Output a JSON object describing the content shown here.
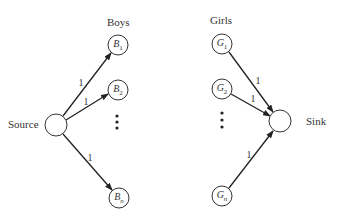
{
  "headings": {
    "boys": "Boys",
    "girls": "Girls",
    "source": "Source",
    "sink": "Sink"
  },
  "nodes": {
    "source": {
      "x": 56,
      "y": 125,
      "r": 11
    },
    "sink": {
      "x": 280,
      "y": 121,
      "r": 11
    },
    "boys": [
      {
        "name": "B",
        "sub": "1",
        "x": 118,
        "y": 45,
        "r": 10
      },
      {
        "name": "B",
        "sub": "2",
        "x": 118,
        "y": 90,
        "r": 10
      },
      {
        "name": "B",
        "sub": "n",
        "x": 119,
        "y": 198,
        "r": 10
      }
    ],
    "girls": [
      {
        "name": "G",
        "sub": "1",
        "x": 222,
        "y": 44,
        "r": 10
      },
      {
        "name": "G",
        "sub": "2",
        "x": 222,
        "y": 89,
        "r": 10
      },
      {
        "name": "G",
        "sub": "n",
        "x": 222,
        "y": 196,
        "r": 10
      }
    ]
  },
  "edge_labels": {
    "source_b1": "1",
    "source_b2": "1",
    "source_bn": "1",
    "g1_sink": "1",
    "g2_sink": "1",
    "gn_sink": "1"
  },
  "ellipsis": "⋮"
}
